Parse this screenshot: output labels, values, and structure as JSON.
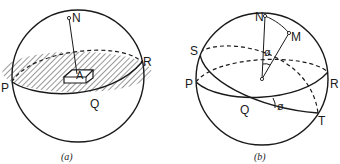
{
  "figure_a": {
    "caption": "(a)",
    "labels": {
      "N": "N",
      "R": "R",
      "P": "P",
      "Q": "Q",
      "A": "A"
    }
  },
  "figure_b": {
    "caption": "(b)",
    "labels": {
      "N": "N",
      "M": "M",
      "S": "S",
      "P": "P",
      "R": "R",
      "Q": "Q",
      "T": "T",
      "angle_top": "ø",
      "angle_bottom": "ø"
    }
  },
  "colors": {
    "ink": "#1a1a1a",
    "paper": "#ffffff"
  }
}
